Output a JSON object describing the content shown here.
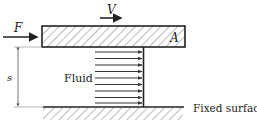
{
  "diagram": {
    "labels": {
      "force": "F",
      "velocity": "V",
      "area": "A",
      "gap": "s",
      "fluid": "Fluid",
      "fixed_surface": "Fixed surface"
    },
    "velocity_profile": {
      "arrow_count": 9,
      "profile": "uniform"
    },
    "colors": {
      "stroke": "#222222",
      "hatch": "#444444",
      "dimension": "#777777",
      "background": "#ffffff"
    }
  }
}
